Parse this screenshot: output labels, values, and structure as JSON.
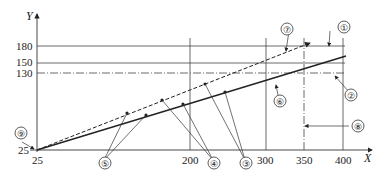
{
  "diagram": {
    "axes": {
      "x_label": "X",
      "y_label": "Y",
      "x_ticks": [
        {
          "label": "25",
          "value": 25
        },
        {
          "label": "200",
          "value": 200
        },
        {
          "label": "300",
          "value": 300
        },
        {
          "label": "350",
          "value": 350
        },
        {
          "label": "400",
          "value": 400
        }
      ],
      "y_ticks": [
        {
          "label": "180",
          "value": 180
        },
        {
          "label": "150",
          "value": 150
        },
        {
          "label": "130",
          "value": 130
        },
        {
          "label": "25",
          "value": 25
        }
      ]
    },
    "callouts": [
      {
        "id": "1",
        "label": "①"
      },
      {
        "id": "2",
        "label": "②"
      },
      {
        "id": "3",
        "label": "③"
      },
      {
        "id": "4",
        "label": "④"
      },
      {
        "id": "5",
        "label": "⑤"
      },
      {
        "id": "6",
        "label": "⑥"
      },
      {
        "id": "7",
        "label": "⑦"
      },
      {
        "id": "8",
        "label": "⑧"
      },
      {
        "id": "9",
        "label": "⑨"
      }
    ],
    "lines": {
      "solid_line": "solid",
      "dashed_line": "dashed",
      "limit_130": "dash-dot",
      "limit_350": "dash-dot"
    }
  }
}
